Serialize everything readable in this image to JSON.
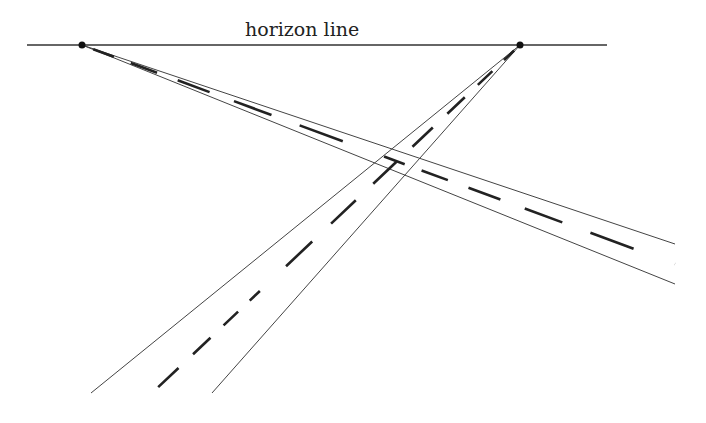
{
  "diagram": {
    "title_label": "horizon line",
    "colors": {
      "line": "#333333",
      "dash": "#222222",
      "background": "#ffffff"
    },
    "horizon": {
      "y": 45,
      "x1": 27,
      "x2": 607
    },
    "vanishing_points": [
      {
        "name": "left-vanishing-point",
        "x": 82,
        "y": 45
      },
      {
        "name": "right-vanishing-point",
        "x": 520,
        "y": 45
      }
    ],
    "roads": [
      {
        "name": "road-receding-to-left-vp",
        "edge_a_end": [
          675,
          244
        ],
        "edge_b_end": [
          675,
          284
        ],
        "center_end": [
          675,
          264
        ]
      },
      {
        "name": "road-receding-to-right-vp",
        "edge_a_end": [
          91,
          393
        ],
        "edge_b_end": [
          212,
          393
        ],
        "center_end": [
          152,
          393
        ]
      }
    ]
  }
}
